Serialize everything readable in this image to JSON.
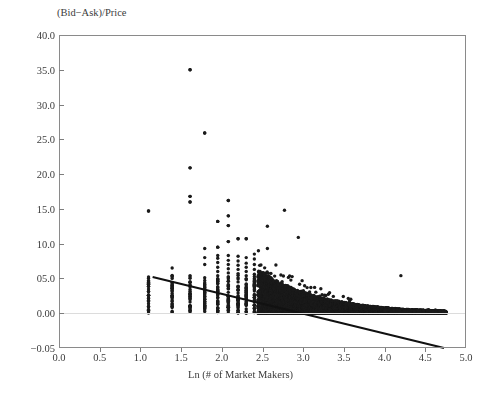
{
  "chart_data": {
    "type": "scatter",
    "title": "",
    "ylabel": "(Bid−Ask)/Price",
    "xlabel": "Ln (# of Market Makers)",
    "xlim": [
      0.0,
      5.0
    ],
    "ylim": [
      -0.05,
      40.0
    ],
    "grid": false,
    "legend": null,
    "xticks": [
      0.0,
      0.5,
      1.0,
      1.5,
      2.0,
      2.5,
      3.0,
      3.5,
      4.0,
      4.5,
      5.0
    ],
    "xtick_labels": [
      "0.0",
      "0.5",
      "1.0",
      "1.5",
      "2.0",
      "2.5",
      "3.0",
      "3.5",
      "4.0",
      "4.5",
      "5.0"
    ],
    "yticks": [
      40.0,
      35.0,
      30.0,
      25.0,
      20.0,
      15.0,
      10.0,
      5.0,
      0.0,
      -0.05
    ],
    "ytick_labels": [
      "40.0",
      "35.0",
      "30.0",
      "25.0",
      "20.0",
      "15.0",
      "10.0",
      "05.0",
      "0.00",
      "−0.05"
    ],
    "zero_gridline": 0.0,
    "marker": {
      "shape": "circle",
      "color": "#1a1a1a",
      "size": 3.4
    },
    "trendline": {
      "type": "linear",
      "color": "#111111",
      "width": 2.0,
      "x_start": 1.15,
      "y_start": 5.2,
      "x_end": 4.73,
      "y_end": -1.8
    },
    "notable_outliers": [
      {
        "x": 1.61,
        "y": 35.0
      },
      {
        "x": 1.79,
        "y": 25.9
      },
      {
        "x": 1.61,
        "y": 20.9
      },
      {
        "x": 1.61,
        "y": 16.8
      },
      {
        "x": 1.61,
        "y": 16.0
      },
      {
        "x": 2.08,
        "y": 16.2
      },
      {
        "x": 1.1,
        "y": 14.7
      },
      {
        "x": 2.77,
        "y": 14.8
      },
      {
        "x": 2.08,
        "y": 14.0
      },
      {
        "x": 1.95,
        "y": 13.2
      },
      {
        "x": 2.08,
        "y": 12.6
      },
      {
        "x": 2.56,
        "y": 12.5
      },
      {
        "x": 2.94,
        "y": 10.9
      },
      {
        "x": 2.2,
        "y": 10.7
      },
      {
        "x": 2.3,
        "y": 10.7
      },
      {
        "x": 2.08,
        "y": 10.3
      },
      {
        "x": 1.95,
        "y": 9.5
      },
      {
        "x": 2.56,
        "y": 9.3
      },
      {
        "x": 4.2,
        "y": 5.4
      }
    ],
    "columns": [
      {
        "x": 1.1,
        "values": [
          2.6,
          2.2,
          0.9,
          14.7
        ]
      },
      {
        "x": 1.39,
        "values": [
          6.5,
          4.4,
          4.0,
          3.6,
          2.3,
          1.9,
          1.4
        ]
      },
      {
        "x": 1.61,
        "values": [
          35.0,
          20.9,
          16.8,
          16.0,
          4.0,
          3.4,
          2.8,
          2.2,
          1.6,
          1.0,
          0.6
        ]
      },
      {
        "x": 1.79,
        "values": [
          25.9,
          9.3,
          8.0,
          7.0,
          5.1,
          4.7,
          4.2,
          3.8,
          3.3,
          2.9,
          2.4,
          2.0,
          1.5,
          1.0,
          0.5
        ]
      },
      {
        "x": 1.95,
        "values": [
          13.2,
          9.5,
          8.3,
          7.9,
          7.3,
          6.6,
          6.0,
          5.4,
          4.8,
          4.3,
          3.8,
          3.3,
          2.8,
          2.3,
          1.8,
          1.3,
          0.8,
          0.3
        ]
      },
      {
        "x": 2.08,
        "values": [
          16.2,
          14.0,
          12.6,
          10.3,
          8.3,
          7.6,
          7.0,
          6.4,
          5.8,
          5.2,
          4.6,
          4.0,
          3.5,
          3.0,
          2.5,
          2.0,
          1.5,
          1.0,
          0.5
        ]
      },
      {
        "x": 2.2,
        "values": [
          10.7,
          8.2,
          7.5,
          6.9,
          6.3,
          5.7,
          5.1,
          4.5,
          3.9,
          3.4,
          2.9,
          2.4,
          1.9,
          1.4,
          0.9,
          0.4
        ]
      },
      {
        "x": 2.3,
        "values": [
          10.7,
          8.0,
          7.2,
          6.6,
          6.0,
          5.4,
          4.8,
          4.2,
          3.6,
          3.1,
          2.6,
          2.1,
          1.6,
          1.1,
          0.6,
          0.2
        ]
      },
      {
        "x": 2.4,
        "values": [
          8.5,
          7.8,
          7.0,
          6.3,
          5.6,
          5.0,
          4.4,
          3.8,
          3.2,
          2.7,
          2.2,
          1.7,
          1.2,
          0.7,
          0.3
        ]
      }
    ],
    "dense_region": {
      "x_from": 2.45,
      "x_to": 4.75,
      "description": "solid dense mass of points tapering from ~0–6 at x=2.5 toward ~0–0.3 at x=4.7",
      "upper_at_x_from": 6.3,
      "upper_at_x_to": 0.3
    },
    "n_points_estimate": 4000
  }
}
